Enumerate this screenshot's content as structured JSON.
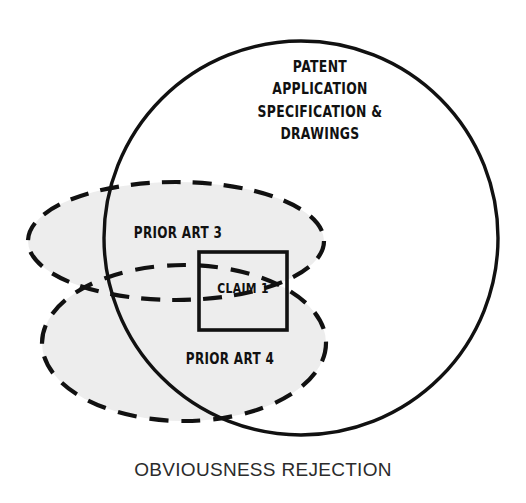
{
  "diagram": {
    "title_caption": "OBVIOUSNESS REJECTION",
    "background_color": "#ffffff",
    "stroke_color": "#111111",
    "shade_color": "#ededed",
    "regions": {
      "application": {
        "label": "PATENT\nAPPLICATION\nSPECIFICATION &\nDRAWINGS",
        "shape": "circle",
        "style": "solid",
        "filled": false
      },
      "prior_art_3": {
        "label": "PRIOR ART 3",
        "shape": "ellipse",
        "style": "dashed",
        "filled": true
      },
      "prior_art_4": {
        "label": "PRIOR ART 4",
        "shape": "ellipse",
        "style": "dashed",
        "filled": true
      },
      "claim": {
        "label": "CLAIM 1",
        "shape": "rectangle",
        "style": "solid",
        "filled": false
      }
    }
  }
}
